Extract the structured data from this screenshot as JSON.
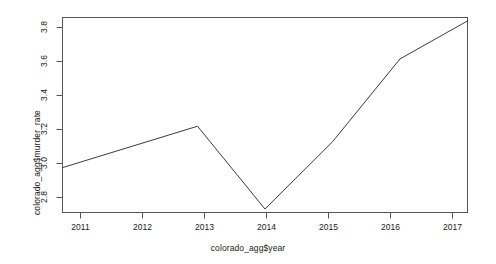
{
  "chart_data": {
    "type": "line",
    "title": "",
    "subtitle": "",
    "xlabel": "colorado_agg$year",
    "ylabel": "colorado_agg$murder_rate",
    "x": [
      2011,
      2012,
      2013,
      2014,
      2015,
      2016,
      2017
    ],
    "values": [
      2.99,
      3.11,
      3.23,
      2.75,
      3.14,
      3.62,
      3.84
    ],
    "series": [
      {
        "name": "colorado_agg$murder_rate",
        "values": [
          2.99,
          3.11,
          3.23,
          2.75,
          3.14,
          3.62,
          3.84
        ]
      }
    ],
    "xtick_labels": [
      "2011",
      "2012",
      "2013",
      "2014",
      "2015",
      "2016",
      "2017"
    ],
    "xticks": [
      2011,
      2012,
      2013,
      2014,
      2015,
      2016,
      2017
    ],
    "ytick_labels": [
      "2.8",
      "3.0",
      "3.2",
      "3.4",
      "3.6",
      "3.8"
    ],
    "yticks": [
      2.8,
      3.0,
      3.2,
      3.4,
      3.6,
      3.8
    ],
    "xlim": [
      2011,
      2017
    ],
    "ylim": [
      2.73,
      3.86
    ],
    "grid": false,
    "legend": false,
    "legend_position": "none",
    "line_color": "#3b3b3b",
    "background_color": "#ffffff",
    "axis_color": "#555555"
  }
}
